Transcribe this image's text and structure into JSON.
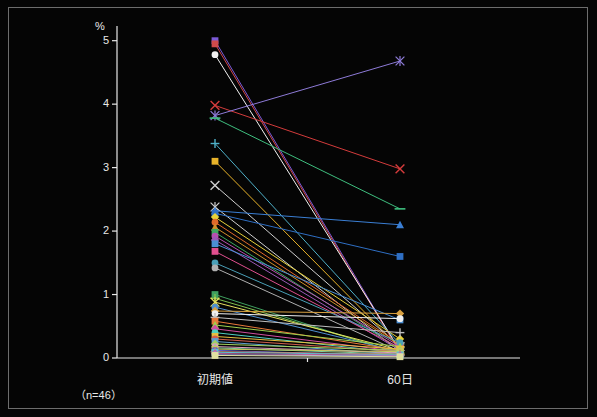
{
  "chart_data": {
    "type": "line",
    "title": "",
    "subtitle": "",
    "ylabel": "%",
    "xlabel": "",
    "note": "（n=46）",
    "categories": [
      "初期値",
      "60日"
    ],
    "ylim": [
      0,
      5.2
    ],
    "yticks": [
      0,
      1,
      2,
      3,
      4,
      5
    ],
    "ytick_labels": [
      "0",
      "1",
      "2",
      "3",
      "4",
      "5"
    ],
    "grid": false,
    "legend": "none",
    "series": [
      {
        "name": "s1",
        "color": "#7b5ad6",
        "marker": "square",
        "values": [
          5.0,
          0.1
        ]
      },
      {
        "name": "s2",
        "color": "#d04a4a",
        "marker": "square",
        "values": [
          4.95,
          0.08
        ]
      },
      {
        "name": "s3",
        "color": "#f2f2f2",
        "marker": "circle",
        "values": [
          4.78,
          0.12
        ]
      },
      {
        "name": "s4",
        "color": "#d43c3c",
        "marker": "cross",
        "values": [
          3.98,
          2.98
        ]
      },
      {
        "name": "s5",
        "color": "#8e7bd8",
        "marker": "star",
        "values": [
          3.82,
          4.68
        ]
      },
      {
        "name": "s6",
        "color": "#3fbf7f",
        "marker": "line",
        "values": [
          3.78,
          2.35
        ]
      },
      {
        "name": "s7",
        "color": "#4fb0c8",
        "marker": "plus",
        "values": [
          3.38,
          0.22
        ]
      },
      {
        "name": "s8",
        "color": "#e8b32a",
        "marker": "square",
        "values": [
          3.1,
          0.16
        ]
      },
      {
        "name": "s9",
        "color": "#cfcfcf",
        "marker": "cross",
        "values": [
          2.72,
          0.18
        ]
      },
      {
        "name": "s10",
        "color": "#cfcfcf",
        "marker": "star",
        "values": [
          2.38,
          0.1
        ]
      },
      {
        "name": "s11",
        "color": "#3b7fd4",
        "marker": "triangle",
        "values": [
          2.32,
          2.1
        ]
      },
      {
        "name": "s12",
        "color": "#2f6fc4",
        "marker": "square",
        "values": [
          2.28,
          1.6
        ]
      },
      {
        "name": "s13",
        "color": "#e8d23a",
        "marker": "diamond",
        "values": [
          2.22,
          0.3
        ]
      },
      {
        "name": "s14",
        "color": "#e06a2a",
        "marker": "circle",
        "values": [
          2.14,
          0.22
        ]
      },
      {
        "name": "s15",
        "color": "#d0902a",
        "marker": "triangle",
        "values": [
          2.06,
          0.2
        ]
      },
      {
        "name": "s16",
        "color": "#3fa85f",
        "marker": "square",
        "values": [
          1.98,
          0.14
        ]
      },
      {
        "name": "s17",
        "color": "#b84fb0",
        "marker": "circle",
        "values": [
          1.92,
          0.18
        ]
      },
      {
        "name": "s18",
        "color": "#9b59b6",
        "marker": "diamond",
        "values": [
          1.86,
          0.12
        ]
      },
      {
        "name": "s19",
        "color": "#4a8fd4",
        "marker": "square",
        "values": [
          1.8,
          0.6
        ]
      },
      {
        "name": "s20",
        "color": "#e04f8f",
        "marker": "square",
        "values": [
          1.68,
          0.16
        ]
      },
      {
        "name": "s21",
        "color": "#4aa0b8",
        "marker": "circle",
        "values": [
          1.5,
          0.24
        ]
      },
      {
        "name": "s22",
        "color": "#b0b0b0",
        "marker": "circle",
        "values": [
          1.42,
          0.1
        ]
      },
      {
        "name": "s23",
        "color": "#3fa05f",
        "marker": "square",
        "values": [
          1.0,
          0.06
        ]
      },
      {
        "name": "s24",
        "color": "#7fc04f",
        "marker": "plus",
        "values": [
          0.94,
          0.08
        ]
      },
      {
        "name": "s25",
        "color": "#e8e060",
        "marker": "star",
        "values": [
          0.88,
          0.12
        ]
      },
      {
        "name": "s26",
        "color": "#4f8fd0",
        "marker": "circle",
        "values": [
          0.8,
          0.1
        ]
      },
      {
        "name": "s27",
        "color": "#d8a040",
        "marker": "diamond",
        "values": [
          0.74,
          0.7
        ]
      },
      {
        "name": "s28",
        "color": "#f0f0f0",
        "marker": "circle",
        "values": [
          0.7,
          0.62
        ]
      },
      {
        "name": "s29",
        "color": "#c0c0c0",
        "marker": "plus",
        "values": [
          0.64,
          0.4
        ]
      },
      {
        "name": "s30",
        "color": "#e87a3a",
        "marker": "square",
        "values": [
          0.58,
          0.12
        ]
      },
      {
        "name": "s31",
        "color": "#9fd04f",
        "marker": "triangle",
        "values": [
          0.52,
          0.18
        ]
      },
      {
        "name": "s32",
        "color": "#d04fa0",
        "marker": "diamond",
        "values": [
          0.46,
          0.1
        ]
      },
      {
        "name": "s33",
        "color": "#4fd0c0",
        "marker": "circle",
        "values": [
          0.4,
          0.08
        ]
      },
      {
        "name": "s34",
        "color": "#e8c040",
        "marker": "square",
        "values": [
          0.34,
          0.14
        ]
      },
      {
        "name": "s35",
        "color": "#d0604f",
        "marker": "circle",
        "values": [
          0.3,
          0.1
        ]
      },
      {
        "name": "s36",
        "color": "#5f9fd0",
        "marker": "square",
        "values": [
          0.26,
          0.06
        ]
      },
      {
        "name": "s37",
        "color": "#a0d060",
        "marker": "diamond",
        "values": [
          0.22,
          0.12
        ]
      },
      {
        "name": "s38",
        "color": "#e0a0c0",
        "marker": "circle",
        "values": [
          0.18,
          0.08
        ]
      },
      {
        "name": "s39",
        "color": "#80d0a0",
        "marker": "triangle",
        "values": [
          0.16,
          0.06
        ]
      },
      {
        "name": "s40",
        "color": "#c8c860",
        "marker": "square",
        "values": [
          0.14,
          0.1
        ]
      },
      {
        "name": "s41",
        "color": "#6060d0",
        "marker": "circle",
        "values": [
          0.12,
          0.04
        ]
      },
      {
        "name": "s42",
        "color": "#d08060",
        "marker": "plus",
        "values": [
          0.1,
          0.06
        ]
      },
      {
        "name": "s43",
        "color": "#60c0d0",
        "marker": "square",
        "values": [
          0.09,
          0.05
        ]
      },
      {
        "name": "s44",
        "color": "#c060a0",
        "marker": "diamond",
        "values": [
          0.07,
          0.04
        ]
      },
      {
        "name": "s45",
        "color": "#a0a0e0",
        "marker": "circle",
        "values": [
          0.05,
          0.03
        ]
      },
      {
        "name": "s46",
        "color": "#e0e0a0",
        "marker": "square",
        "values": [
          0.04,
          0.02
        ]
      }
    ]
  },
  "axis": {
    "y_title": "%",
    "ytick_labels": [
      "0",
      "1",
      "2",
      "3",
      "4",
      "5"
    ],
    "category_labels": [
      "初期値",
      "60日"
    ],
    "note": "（n=46）"
  }
}
